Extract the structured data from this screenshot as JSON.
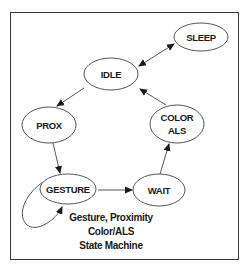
{
  "diagram": {
    "type": "state-machine",
    "border_color": "#3a3a3a",
    "line_color": "#555555",
    "text_color": "#1a1a1a",
    "nodes": [
      {
        "id": "sleep",
        "label_lines": [
          "SLEEP"
        ],
        "cx": 201,
        "cy": 37,
        "rx": 27,
        "ry": 14
      },
      {
        "id": "idle",
        "label_lines": [
          "IDLE"
        ],
        "cx": 111,
        "cy": 74,
        "rx": 27,
        "ry": 16
      },
      {
        "id": "prox",
        "label_lines": [
          "PROX"
        ],
        "cx": 49,
        "cy": 125,
        "rx": 27,
        "ry": 18
      },
      {
        "id": "color_als",
        "label_lines": [
          "COLOR",
          "ALS"
        ],
        "cx": 177,
        "cy": 124,
        "rx": 27,
        "ry": 19
      },
      {
        "id": "gesture",
        "label_lines": [
          "GESTURE"
        ],
        "cx": 68,
        "cy": 189,
        "rx": 28,
        "ry": 15
      },
      {
        "id": "wait",
        "label_lines": [
          "WAIT"
        ],
        "cx": 159,
        "cy": 190,
        "rx": 26,
        "ry": 16
      }
    ],
    "edges": [
      {
        "from": "idle",
        "to": "sleep",
        "bidirectional": true
      },
      {
        "from": "idle",
        "to": "prox",
        "bidirectional": false
      },
      {
        "from": "prox",
        "to": "gesture",
        "bidirectional": false
      },
      {
        "from": "gesture",
        "to": "wait",
        "bidirectional": false
      },
      {
        "from": "wait",
        "to": "color_als",
        "bidirectional": false
      },
      {
        "from": "color_als",
        "to": "idle",
        "bidirectional": false
      },
      {
        "from": "gesture",
        "to": "gesture",
        "bidirectional": false,
        "self_loop": true
      }
    ],
    "caption": {
      "line1": "Gesture, Proximity",
      "line2": "Color/ALS",
      "line3": "State Machine"
    }
  }
}
